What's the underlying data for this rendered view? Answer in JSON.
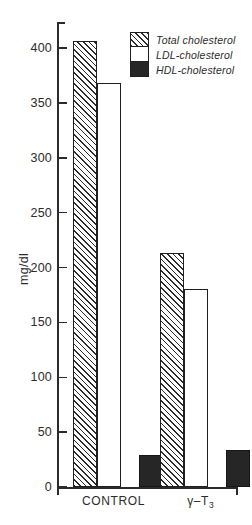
{
  "chart_data": {
    "type": "bar",
    "title": "",
    "subtitle": "",
    "xlabel": "",
    "ylabel": "mg/dl",
    "ylim": [
      0,
      420
    ],
    "yticks": [
      0,
      50,
      100,
      150,
      200,
      250,
      300,
      350,
      400
    ],
    "ytick_labels": [
      "0",
      "50",
      "100",
      "150",
      "200",
      "250",
      "300",
      "350",
      "400"
    ],
    "grid": false,
    "legend_position": "top-right",
    "categories": [
      "CONTROL",
      "γ–T₃"
    ],
    "category_labels_html": [
      "CONTROL",
      "γ–T<sub>3</sub>"
    ],
    "series": [
      {
        "name": "Total cholesterol",
        "fill": "hatched",
        "values": [
          406,
          213
        ]
      },
      {
        "name": "LDL-cholesterol",
        "fill": "white",
        "values": [
          368,
          180
        ]
      },
      {
        "name": "HDL-cholesterol",
        "fill": "black",
        "values": [
          29,
          34
        ]
      }
    ],
    "legend": [
      {
        "label": "Total cholesterol",
        "swatch": "hatched-swatch"
      },
      {
        "label": "LDL-cholesterol",
        "swatch": "white-swatch"
      },
      {
        "label": "HDL-cholesterol",
        "swatch": "black-swatch"
      }
    ],
    "colors": {
      "axis": "#2b2b2b",
      "bar_outline": "#1f1f1f",
      "hatch": "#2b2b2b",
      "white_fill": "#ffffff",
      "black_fill": "#262626",
      "background": "#ffffff"
    }
  },
  "axis": {
    "y_title": "mg/dl"
  }
}
